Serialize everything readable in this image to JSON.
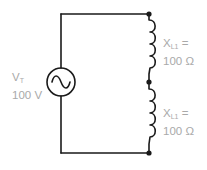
{
  "diagram": {
    "type": "series inductive circuit",
    "colors": {
      "wire": "#1a1a1a",
      "label": "#a9a9a9",
      "background": "#ffffff"
    },
    "source": {
      "symbol": "ac-voltage-source",
      "name_main": "V",
      "name_sub": "T",
      "value": "100 V"
    },
    "inductors": [
      {
        "name_main": "X",
        "name_sub": "L1",
        "equals": "=",
        "value": "100 Ω"
      },
      {
        "name_main": "X",
        "name_sub": "L1",
        "equals": "=",
        "value": "100 Ω"
      }
    ]
  }
}
